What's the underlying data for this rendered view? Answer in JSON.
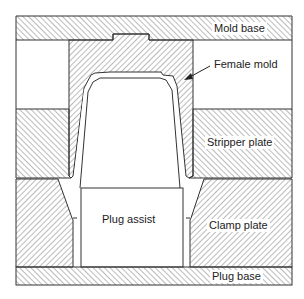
{
  "diagram": {
    "type": "cross-section",
    "colors": {
      "line": "#333333",
      "hatch": "#555555",
      "background": "#ffffff"
    },
    "labels": {
      "mold_base": "Mold base",
      "female_mold": "Female mold",
      "stripper_plate": "Stripper plate",
      "plug_assist": "Plug assist",
      "clamp_plate": "Clamp plate",
      "plug_base": "Plug base"
    },
    "components": [
      {
        "id": "mold_base",
        "label": "Mold base",
        "hatched": true
      },
      {
        "id": "female_mold",
        "label": "Female mold",
        "hatched": true,
        "annotated_with_arrow": true
      },
      {
        "id": "stripper_plate",
        "label": "Stripper plate",
        "hatched": true
      },
      {
        "id": "plug_assist",
        "label": "Plug assist",
        "hatched": false
      },
      {
        "id": "clamp_plate",
        "label": "Clamp plate",
        "hatched": true
      },
      {
        "id": "plug_base",
        "label": "Plug base",
        "hatched": true
      }
    ]
  }
}
